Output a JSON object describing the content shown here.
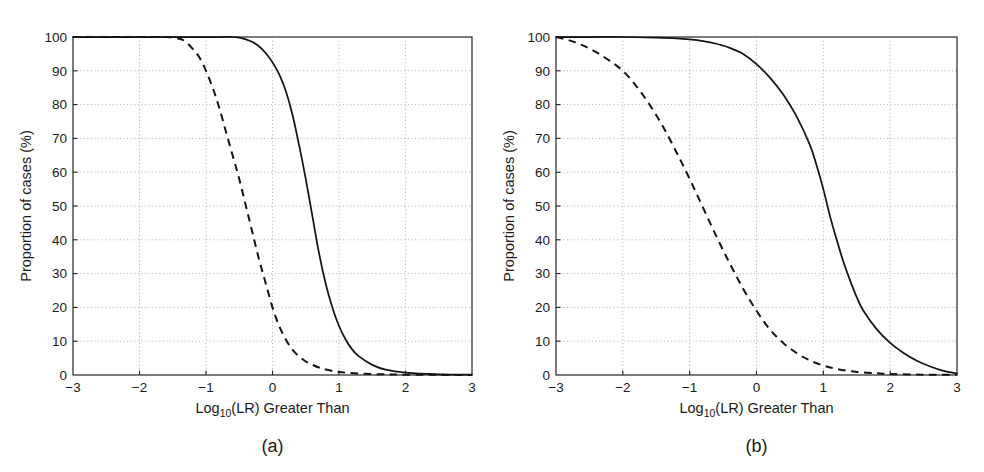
{
  "figure": {
    "background_color": "#ffffff",
    "axis_color": "#1d1d1d",
    "grid_color": "#9a9a9a",
    "curve_color": "#141414"
  },
  "panels": [
    {
      "caption": "(a)",
      "xlabel_main": "Log",
      "xlabel_sub": "10",
      "xlabel_rest": "(LR) Greater Than",
      "ylabel": "Proportion of cases (%)"
    },
    {
      "caption": "(b)",
      "xlabel_main": "Log",
      "xlabel_sub": "10",
      "xlabel_rest": "(LR) Greater Than",
      "ylabel": "Proportion of cases (%)"
    }
  ],
  "axes": {
    "x_ticks": [
      "-3",
      "-2",
      "-1",
      "0",
      "1",
      "2",
      "3"
    ],
    "y_ticks": [
      "0",
      "10",
      "20",
      "30",
      "40",
      "50",
      "60",
      "70",
      "80",
      "90",
      "100"
    ]
  },
  "chart_data": [
    {
      "type": "line",
      "panel": "(a)",
      "title": "",
      "xlabel": "Log10(LR) Greater Than",
      "ylabel": "Proportion of cases (%)",
      "xlim": [
        -3,
        3
      ],
      "ylim": [
        0,
        100
      ],
      "xticks": [
        -3,
        -2,
        -1,
        0,
        1,
        2,
        3
      ],
      "yticks": [
        0,
        10,
        20,
        30,
        40,
        50,
        60,
        70,
        80,
        90,
        100
      ],
      "grid": true,
      "legend": "none",
      "series": [
        {
          "name": "solid-curve",
          "style": "solid",
          "x": [
            -3.0,
            -2.5,
            -2.0,
            -1.5,
            -1.2,
            -1.0,
            -0.8,
            -0.6,
            -0.5,
            -0.4,
            -0.3,
            -0.2,
            -0.1,
            0.0,
            0.1,
            0.2,
            0.3,
            0.4,
            0.5,
            0.6,
            0.7,
            0.8,
            0.9,
            1.0,
            1.1,
            1.2,
            1.3,
            1.5,
            1.7,
            2.0,
            2.5,
            3.0
          ],
          "y": [
            100,
            100,
            100,
            100,
            100,
            100,
            100,
            100,
            99.8,
            99.3,
            98.5,
            97.2,
            95.2,
            92.5,
            89.0,
            84.0,
            77.0,
            68.0,
            58.0,
            47.0,
            36.0,
            27.0,
            20.0,
            14.5,
            10.5,
            7.5,
            5.5,
            3.0,
            1.6,
            0.7,
            0.2,
            0.1
          ]
        },
        {
          "name": "dashed-curve",
          "style": "dashed",
          "x": [
            -3.0,
            -2.5,
            -2.0,
            -1.6,
            -1.4,
            -1.3,
            -1.2,
            -1.1,
            -1.0,
            -0.9,
            -0.8,
            -0.7,
            -0.6,
            -0.5,
            -0.4,
            -0.3,
            -0.2,
            -0.1,
            0.0,
            0.1,
            0.2,
            0.3,
            0.4,
            0.5,
            0.6,
            0.7,
            0.8,
            1.0,
            1.3,
            1.7,
            2.0,
            2.5,
            3.0
          ],
          "y": [
            100,
            100,
            100,
            100,
            99.5,
            98.5,
            96.5,
            94.0,
            90.0,
            85.0,
            79.0,
            72.0,
            65.0,
            58.0,
            50.0,
            42.0,
            34.0,
            27.0,
            20.0,
            14.5,
            10.5,
            7.5,
            5.5,
            4.0,
            3.0,
            2.2,
            1.6,
            0.9,
            0.4,
            0.2,
            0.1,
            0.05,
            0.0
          ]
        }
      ]
    },
    {
      "type": "line",
      "panel": "(b)",
      "title": "",
      "xlabel": "Log10(LR) Greater Than",
      "ylabel": "Proportion of cases (%)",
      "xlim": [
        -3,
        3
      ],
      "ylim": [
        0,
        100
      ],
      "xticks": [
        -3,
        -2,
        -1,
        0,
        1,
        2,
        3
      ],
      "yticks": [
        0,
        10,
        20,
        30,
        40,
        50,
        60,
        70,
        80,
        90,
        100
      ],
      "grid": true,
      "legend": "none",
      "series": [
        {
          "name": "solid-curve",
          "style": "solid",
          "x": [
            -3.0,
            -2.5,
            -2.0,
            -1.5,
            -1.2,
            -1.0,
            -0.8,
            -0.6,
            -0.4,
            -0.2,
            0.0,
            0.2,
            0.4,
            0.6,
            0.8,
            0.9,
            1.0,
            1.1,
            1.2,
            1.3,
            1.4,
            1.5,
            1.6,
            1.8,
            2.0,
            2.2,
            2.4,
            2.6,
            2.8,
            3.0
          ],
          "y": [
            100,
            100,
            100,
            99.8,
            99.6,
            99.3,
            98.8,
            98.0,
            96.8,
            95.0,
            92.0,
            88.0,
            83.0,
            76.5,
            68.0,
            62.0,
            55.0,
            47.0,
            40.0,
            33.5,
            28.0,
            23.0,
            19.0,
            13.5,
            9.5,
            6.5,
            4.2,
            2.5,
            1.2,
            0.4
          ]
        },
        {
          "name": "dashed-curve",
          "style": "dashed",
          "x": [
            -3.0,
            -2.8,
            -2.6,
            -2.4,
            -2.2,
            -2.0,
            -1.8,
            -1.6,
            -1.4,
            -1.2,
            -1.0,
            -0.8,
            -0.6,
            -0.4,
            -0.2,
            0.0,
            0.2,
            0.4,
            0.6,
            0.8,
            1.0,
            1.2,
            1.5,
            1.8,
            2.0,
            2.5,
            3.0
          ],
          "y": [
            100,
            99.0,
            97.5,
            95.5,
            93.0,
            90.0,
            85.5,
            80.0,
            73.5,
            66.0,
            58.0,
            49.5,
            41.0,
            33.0,
            25.5,
            19.0,
            13.5,
            9.5,
            6.5,
            4.3,
            2.8,
            1.8,
            0.9,
            0.5,
            0.3,
            0.1,
            0.05
          ]
        }
      ]
    }
  ]
}
